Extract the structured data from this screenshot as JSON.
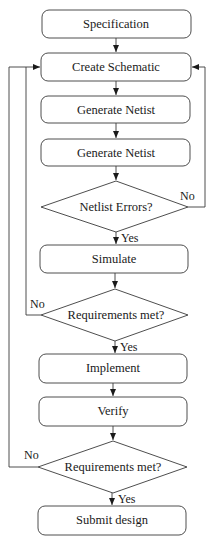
{
  "diagram": {
    "type": "flowchart",
    "nodes": {
      "specification": "Specification",
      "create_schematic": "Create Schematic",
      "generate_netlist_1": "Generate Netist",
      "generate_netlist_2": "Generate Netist",
      "netlist_errors": "Netlist Errors?",
      "simulate": "Simulate",
      "requirements_met_1": "Requirements met?",
      "implement": "Implement",
      "verify": "Verify",
      "requirements_met_2": "Requirements met?",
      "submit_design": "Submit design"
    },
    "edge_labels": {
      "netlist_errors_no": "No",
      "netlist_errors_yes": "Yes",
      "requirements_1_no": "No",
      "requirements_1_yes": "Yes",
      "requirements_2_no": "No",
      "requirements_2_yes": "Yes"
    },
    "colors": {
      "stroke": "#3a3a3a",
      "text": "#1a1a1a",
      "background": "#ffffff"
    }
  }
}
